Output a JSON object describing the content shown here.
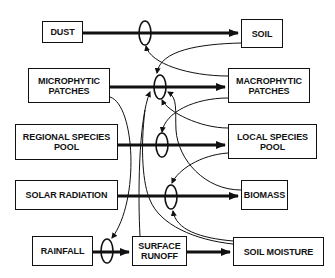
{
  "diagram": {
    "type": "ecosystem state-and-transition / feedback diagram",
    "nodes": {
      "dust": "DUST",
      "soil": "SOIL",
      "microphytic": "MICROPHYTIC\nPATCHES",
      "macrophytic": "MACROPHYTIC\nPATCHES",
      "regional_pool": "REGIONAL SPECIES\nPOOL",
      "local_pool": "LOCAL SPECIES\nPOOL",
      "solar": "SOLAR RADIATION",
      "biomass": "BIOMASS",
      "rainfall": "RAINFALL",
      "runoff": "SURFACE\nRUNOFF",
      "soil_moisture": "SOIL MOISTURE"
    },
    "flows": [
      {
        "from": "DUST",
        "to": "SOIL"
      },
      {
        "from": "MICROPHYTIC PATCHES",
        "to": "MACROPHYTIC PATCHES"
      },
      {
        "from": "REGIONAL SPECIES POOL",
        "to": "LOCAL SPECIES POOL"
      },
      {
        "from": "SOLAR RADIATION",
        "to": "BIOMASS"
      },
      {
        "from": "RAINFALL",
        "to": "SURFACE RUNOFF"
      },
      {
        "from": "SURFACE RUNOFF",
        "to": "SOIL MOISTURE"
      }
    ],
    "colors": {
      "line": "#111111",
      "background": "#ffffff"
    }
  }
}
